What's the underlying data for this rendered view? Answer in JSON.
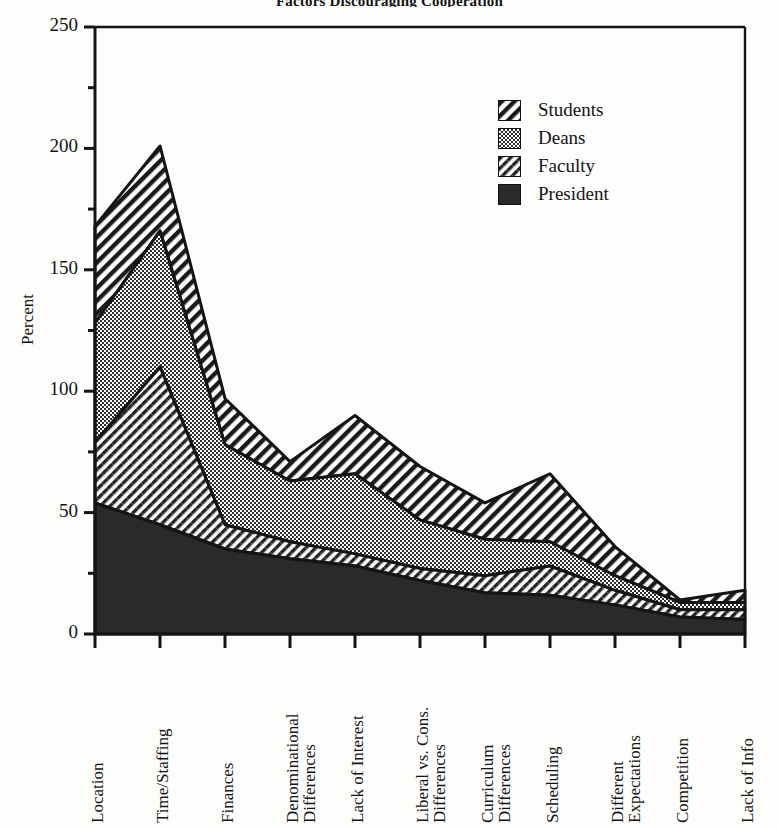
{
  "chart_data": {
    "type": "area",
    "stacked": true,
    "title": "Factors Discouraging Cooperation",
    "xlabel": "",
    "ylabel": "Percent",
    "ylim": [
      0,
      250
    ],
    "yticks": [
      0,
      50,
      100,
      150,
      200,
      250
    ],
    "ytick_labels": [
      "0",
      "50",
      "100",
      "150",
      "200",
      "250"
    ],
    "minor_ytick_step": 25,
    "grid": false,
    "legend_position": "upper right",
    "legend_entries": [
      "Students",
      "Deans",
      "Faculty",
      "President"
    ],
    "categories": [
      "Location",
      "Time/Staffing",
      "Finances",
      "Denominational Differences",
      "Lack of Interest",
      "Liberal vs. Cons. Differences",
      "Curriculum Differences",
      "Scheduling",
      "Different Expectations",
      "Competition",
      "Lack of Info"
    ],
    "category_lines": [
      [
        "Location"
      ],
      [
        "Time/Staffing"
      ],
      [
        "Finances"
      ],
      [
        "Denominational",
        "Differences"
      ],
      [
        "Lack of Interest"
      ],
      [
        "Liberal vs. Cons.",
        "Differences"
      ],
      [
        "Curriculum",
        "Differences"
      ],
      [
        "Scheduling"
      ],
      [
        "Different",
        "Expectations"
      ],
      [
        "Competition"
      ],
      [
        "Lack of Info"
      ]
    ],
    "series": [
      {
        "name": "President",
        "pattern": "solid",
        "values": [
          54,
          45,
          35,
          31,
          28,
          22,
          17,
          16,
          12,
          7,
          6
        ]
      },
      {
        "name": "Faculty",
        "pattern": "sparse-diagonal",
        "values": [
          25,
          65,
          10,
          7,
          5,
          5,
          7,
          12,
          6,
          3,
          4
        ]
      },
      {
        "name": "Deans",
        "pattern": "dotted",
        "values": [
          49,
          56,
          33,
          25,
          33,
          20,
          15,
          10,
          6,
          3,
          3
        ]
      },
      {
        "name": "Students",
        "pattern": "diagonal-hatch",
        "values": [
          40,
          35,
          19,
          8,
          24,
          22,
          15,
          28,
          12,
          1,
          5
        ]
      }
    ],
    "cumulative_totals": [
      168,
      201,
      97,
      71,
      90,
      69,
      54,
      66,
      36,
      14,
      18
    ],
    "axis_pixels": {
      "left": 95,
      "right": 745,
      "top": 27,
      "bottom": 634
    }
  },
  "legend": {
    "items": [
      {
        "label": "Students",
        "pattern": "diagonal-hatch"
      },
      {
        "label": "Deans",
        "pattern": "dotted"
      },
      {
        "label": "Faculty",
        "pattern": "sparse-diagonal"
      },
      {
        "label": "President",
        "pattern": "solid"
      }
    ]
  },
  "colors": {
    "ink": "#141414",
    "background": "#fdfdfc",
    "solid_fill": "#2a2a2a",
    "hatch_fill": "#ffffff",
    "dotted_fill": "#808080"
  }
}
